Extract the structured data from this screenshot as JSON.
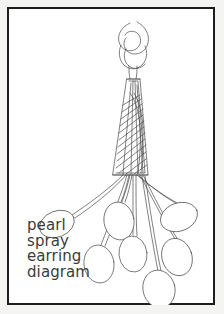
{
  "card": {
    "width": 224,
    "height": 314,
    "background_color": "#ffffff",
    "outer_margin_color": "#f4f4f2",
    "frame_color": "#1d1d1d",
    "frame_width_px": 2
  },
  "caption": {
    "lines": [
      "pearl",
      "spray",
      "earring",
      "diagram"
    ],
    "text_color": "#3b3b3b",
    "font_size_px": 15
  },
  "diagram": {
    "title": "pearl spray earring diagram",
    "line_color": "#4a4a4a",
    "fill_color": "#ffffff",
    "stroke_width": 0.7,
    "parts": [
      {
        "name": "ear-wire-loop",
        "label": "twisted wire loop / ear hook"
      },
      {
        "name": "cone-body",
        "label": "tapered hatched wire cone"
      },
      {
        "name": "wire-strands",
        "label": "fanned wire strands",
        "count": 7
      },
      {
        "name": "pearl-beads",
        "label": "oval pearl beads",
        "count": 7
      }
    ],
    "pearls": [
      {
        "id": "pearl-left-upper",
        "cx": 48,
        "cy": 215,
        "rx": 18,
        "ry": 13,
        "rotate": -22
      },
      {
        "id": "pearl-left-lower",
        "cx": 90,
        "cy": 255,
        "rx": 15,
        "ry": 19,
        "rotate": -8
      },
      {
        "id": "pearl-center-upper",
        "cx": 110,
        "cy": 212,
        "rx": 15,
        "ry": 19,
        "rotate": -10
      },
      {
        "id": "pearl-center-lower",
        "cx": 124,
        "cy": 245,
        "rx": 14,
        "ry": 18,
        "rotate": -6
      },
      {
        "id": "pearl-right-upper",
        "cx": 170,
        "cy": 208,
        "rx": 19,
        "ry": 14,
        "rotate": -20
      },
      {
        "id": "pearl-right-mid",
        "cx": 168,
        "cy": 248,
        "rx": 15,
        "ry": 19,
        "rotate": -18
      },
      {
        "id": "pearl-right-lower",
        "cx": 150,
        "cy": 280,
        "rx": 16,
        "ry": 19,
        "rotate": -14
      }
    ]
  }
}
